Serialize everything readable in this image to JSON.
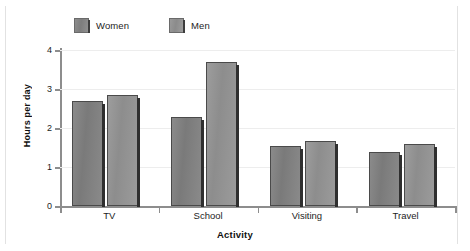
{
  "chart_data": {
    "type": "bar",
    "title": "",
    "subtitle": "",
    "xlabel": "Activity",
    "ylabel": "Hours per day",
    "categories": [
      "TV",
      "School",
      "Visiting",
      "Travel"
    ],
    "series": [
      {
        "name": "Women",
        "values": [
          2.7,
          2.27,
          1.53,
          1.38
        ],
        "color": "#828282"
      },
      {
        "name": "Men",
        "values": [
          2.85,
          3.7,
          1.67,
          1.58
        ],
        "color": "#949494"
      }
    ],
    "ylim": [
      0,
      4
    ],
    "ytick_labels": [
      "0",
      "1",
      "2",
      "3",
      "4"
    ],
    "ytick_values": [
      0,
      1,
      2,
      3,
      4
    ],
    "grid": true,
    "grid_axis": "y",
    "legend_position": "top-left",
    "orientation": "vertical",
    "bar_style": "grouped-3d-shadow"
  },
  "legend": {
    "items": [
      {
        "label": "Women",
        "swatch": "legend-swatch-women"
      },
      {
        "label": "Men",
        "swatch": "legend-swatch-men"
      }
    ]
  },
  "axes": {
    "y_title": "Hours per day",
    "x_title": "Activity",
    "y_ticks": [
      "0",
      "1",
      "2",
      "3",
      "4"
    ],
    "x_categories": [
      "TV",
      "School",
      "Visiting",
      "Travel"
    ]
  },
  "colors": {
    "bar_women": "#828282",
    "bar_men": "#949494",
    "bar_outline": "#4a4a4a",
    "bar_shadow": "#2f2f2f",
    "axis": "#8d8d8d",
    "gridline": "#ededed",
    "text": "#1d1d1d",
    "page_frame": "#e2e2e2",
    "background": "#ffffff"
  }
}
